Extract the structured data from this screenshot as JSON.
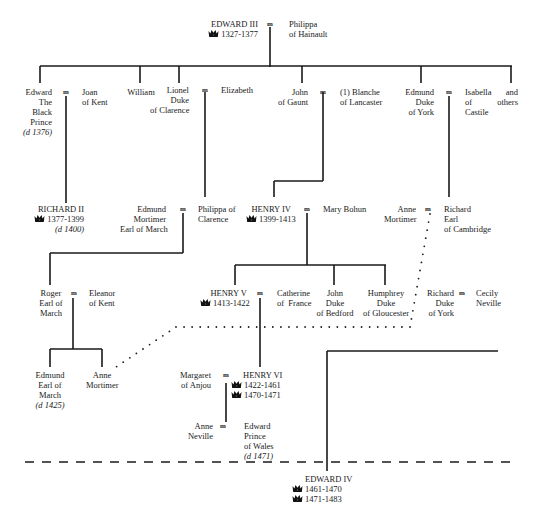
{
  "marriage_symbol": "m",
  "crown_icon": "crown-icon",
  "people": {
    "edward_iii": {
      "name": "EDWARD III",
      "reigns": [
        "1327-1377"
      ]
    },
    "philippa_hainault": {
      "lines": [
        "Philippa",
        "of Hainault"
      ]
    },
    "black_prince": {
      "lines": [
        "Edward",
        "The",
        "Black",
        "Prince",
        "(d 1376)"
      ]
    },
    "joan_kent": {
      "lines": [
        "Joan",
        "of Kent"
      ]
    },
    "william": {
      "lines": [
        "William"
      ]
    },
    "lionel": {
      "lines": [
        "Lionel",
        "Duke",
        "of Clarence"
      ]
    },
    "elizabeth": {
      "lines": [
        "Elizabeth"
      ]
    },
    "john_gaunt": {
      "lines": [
        "John",
        "of Gaunt"
      ]
    },
    "blanche": {
      "lines": [
        "(1) Blanche",
        "of Lancaster"
      ]
    },
    "edmund_york": {
      "lines": [
        "Edmund",
        "Duke",
        "of York"
      ]
    },
    "isabella": {
      "lines": [
        "Isabella",
        "of",
        "Castile"
      ]
    },
    "and_others": {
      "lines": [
        "and",
        "others"
      ]
    },
    "richard_ii": {
      "name": "RICHARD II",
      "reigns": [
        "1377-1399"
      ],
      "death": "(d 1400)"
    },
    "edmund_mortimer": {
      "lines": [
        "Edmund",
        "Mortimer",
        "Earl of March"
      ]
    },
    "philippa_clarence": {
      "lines": [
        "Philippa of",
        "Clarence"
      ]
    },
    "henry_iv": {
      "name": "HENRY IV",
      "reigns": [
        "1399-1413"
      ]
    },
    "mary_bohun": {
      "lines": [
        "Mary Bohun"
      ]
    },
    "anne_mortimer_1": {
      "lines": [
        "Anne",
        "Mortimer"
      ]
    },
    "richard_cambridge": {
      "lines": [
        "Richard",
        "Earl",
        "of Cambridge"
      ]
    },
    "roger": {
      "lines": [
        "Roger",
        "Earl of",
        "March"
      ]
    },
    "eleanor": {
      "lines": [
        "Eleanor",
        "of Kent"
      ]
    },
    "henry_v": {
      "name": "HENRY V",
      "reigns": [
        "1413-1422"
      ]
    },
    "catherine": {
      "lines": [
        "Catherine",
        "of  France"
      ]
    },
    "john_bedford": {
      "lines": [
        "John",
        "Duke",
        "of Bedford"
      ]
    },
    "humphrey": {
      "lines": [
        "Humphrey",
        "Duke",
        "of Gloucester"
      ]
    },
    "richard_york": {
      "lines": [
        "Richard",
        "Duke",
        "of York"
      ]
    },
    "cecily": {
      "lines": [
        "Cecily",
        "Neville"
      ]
    },
    "edmund_march": {
      "lines": [
        "Edmund",
        "Earl of",
        "March",
        "(d 1425)"
      ]
    },
    "anne_mortimer_2": {
      "lines": [
        "Anne",
        "Mortimer"
      ]
    },
    "margaret": {
      "lines": [
        "Margaret",
        "of Anjou"
      ]
    },
    "henry_vi": {
      "name": "HENRY VI",
      "reigns": [
        "1422-1461",
        "1470-1471"
      ]
    },
    "anne_neville": {
      "lines": [
        "Anne",
        "Neville"
      ]
    },
    "edward_wales": {
      "lines": [
        "Edward",
        "Prince",
        "of Wales",
        "(d 1471)"
      ]
    },
    "edward_iv": {
      "name": "EDWARD IV",
      "reigns": [
        "1461-1470",
        "1471-1483"
      ]
    }
  }
}
